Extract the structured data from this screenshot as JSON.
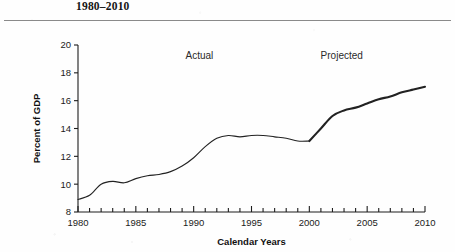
{
  "figure": {
    "title": "1980–2010",
    "has_title_rule": true
  },
  "chart_data": {
    "type": "line",
    "title": "1980–2010",
    "xlabel": "Calendar Years",
    "ylabel": "Percent of GDP",
    "xlim": [
      1980,
      2010
    ],
    "ylim": [
      8,
      20
    ],
    "grid": false,
    "legend": "none",
    "x_ticks_major": [
      1980,
      1985,
      1990,
      1995,
      2000,
      2005,
      2010
    ],
    "x_ticks_minor_step": 1,
    "y_ticks": [
      8,
      10,
      12,
      14,
      16,
      18,
      20
    ],
    "annotations": [
      {
        "text": "Actual",
        "x": 1990.5,
        "y": 19.0
      },
      {
        "text": "Projected",
        "x": 2002.8,
        "y": 19.0
      }
    ],
    "series": [
      {
        "name": "Actual",
        "style": "thin",
        "x": [
          1980,
          1981,
          1982,
          1983,
          1984,
          1985,
          1986,
          1987,
          1988,
          1989,
          1990,
          1991,
          1992,
          1993,
          1994,
          1995,
          1996,
          1997,
          1998,
          1999,
          2000
        ],
        "values": [
          8.9,
          9.2,
          10.0,
          10.2,
          10.1,
          10.4,
          10.6,
          10.7,
          10.9,
          11.3,
          11.9,
          12.7,
          13.3,
          13.5,
          13.4,
          13.5,
          13.5,
          13.4,
          13.3,
          13.1,
          13.1
        ]
      },
      {
        "name": "Projected",
        "style": "thick",
        "x": [
          2000,
          2001,
          2002,
          2003,
          2004,
          2005,
          2006,
          2007,
          2008,
          2009,
          2010
        ],
        "values": [
          13.1,
          14.0,
          14.9,
          15.3,
          15.5,
          15.8,
          16.1,
          16.3,
          16.6,
          16.8,
          17.0
        ]
      }
    ]
  }
}
